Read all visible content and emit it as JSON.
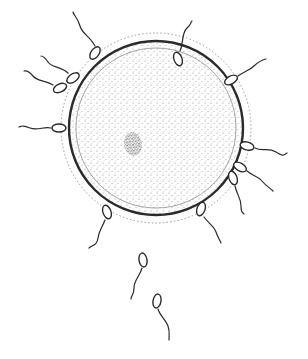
{
  "diagram": {
    "subject": "Ovum surrounded by spermatozoa",
    "colors": {
      "ink": "#2a2a2a",
      "stipple": "#8a8a8a",
      "halo": "#9a9a9a",
      "background": "#ffffff"
    },
    "egg": {
      "center": [
        156,
        128
      ],
      "membrane_radius": 87,
      "inner_radius": 80,
      "halo_radius": 95,
      "nucleus": {
        "center": [
          133,
          144
        ],
        "rx": 9,
        "ry": 12
      }
    },
    "sperm": [
      {
        "head": [
          95,
          53
        ],
        "angle": -55,
        "tail": "M 95 46 C 90 36, 82 34, 80 26 S 74 16, 73 12"
      },
      {
        "head": [
          73,
          78
        ],
        "angle": -35,
        "tail": "M 68 73 C 60 66, 52 68, 48 62 S 42 56, 41 56"
      },
      {
        "head": [
          60,
          88
        ],
        "angle": -25,
        "tail": "M 53 85 C 45 80, 38 82, 33 76 S 26 71, 24 71"
      },
      {
        "head": [
          59,
          128
        ],
        "angle": 0,
        "tail": "M 51 128 C 44 126, 38 131, 30 128 S 22 126, 19 127"
      },
      {
        "head": [
          178,
          59
        ],
        "angle": 70,
        "tail": "M 180 51 C 184 42, 181 34, 187 28 S 190 22, 192 21"
      },
      {
        "head": [
          231,
          80
        ],
        "angle": -30,
        "tail": "M 238 76 C 245 71, 250 70, 254 66 S 262 60, 266 59"
      },
      {
        "head": [
          247,
          146
        ],
        "angle": 15,
        "tail": "M 255 148 C 262 152, 268 147, 276 152 S 283 155, 287 153"
      },
      {
        "head": [
          240,
          167
        ],
        "angle": 30,
        "tail": "M 247 171 C 254 177, 258 176, 262 181 S 270 188, 273 191"
      },
      {
        "head": [
          233,
          178
        ],
        "angle": 70,
        "tail": "M 235 186 C 237 195, 241 198, 241 206 S 243 212, 244 214"
      },
      {
        "head": [
          107,
          212
        ],
        "angle": -110,
        "tail": "M 105 220 C 102 228, 99 230, 98 238 S 92 245, 89 248"
      },
      {
        "head": [
          201,
          209
        ],
        "angle": 110,
        "tail": "M 204 217 C 209 224, 214 226, 216 232 S 220 240, 221 243"
      },
      {
        "head": [
          143,
          260
        ],
        "angle": -100,
        "tail": "M 142 268 C 140 276, 134 280, 134 288 S 131 295, 131 299"
      },
      {
        "head": [
          157,
          301
        ],
        "angle": 100,
        "tail": "M 158 309 C 160 316, 166 320, 168 326 S 169 334, 169 340"
      }
    ]
  }
}
